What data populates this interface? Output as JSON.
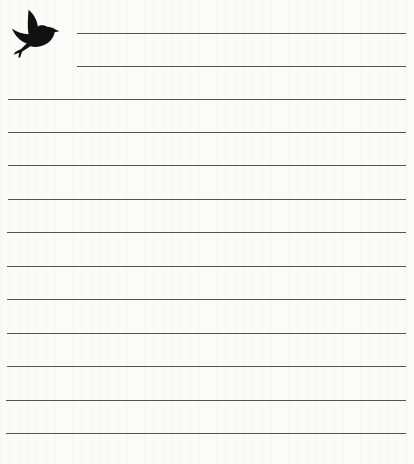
{
  "page": {
    "type": "lined-notepaper",
    "background_color": "#fbfbfa",
    "line_color": "#555555",
    "icon": "bird-icon",
    "header_lines": [
      {
        "top": 33,
        "left": 77
      },
      {
        "top": 66,
        "left": 77
      }
    ],
    "body_lines": [
      {
        "top": 99,
        "left": 8
      },
      {
        "top": 132,
        "left": 8
      },
      {
        "top": 165,
        "left": 8
      },
      {
        "top": 199,
        "left": 8
      },
      {
        "top": 232,
        "left": 7
      },
      {
        "top": 266,
        "left": 7
      },
      {
        "top": 299,
        "left": 7
      },
      {
        "top": 333,
        "left": 7
      },
      {
        "top": 366,
        "left": 7
      },
      {
        "top": 400,
        "left": 6
      },
      {
        "top": 433,
        "left": 6
      }
    ]
  }
}
